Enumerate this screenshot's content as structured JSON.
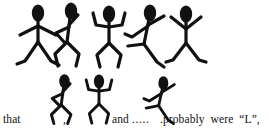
{
  "page": {
    "width": 269,
    "height": 130,
    "background_color": "#ffffff",
    "ink_color": "#111111"
  },
  "figures_row_top": [
    {
      "name": "stick-figure-arms-down-legs-spread",
      "pose": "arms angled down and out, legs spread wide with curled feet"
    },
    {
      "name": "stick-figure-arm-overhead-hand-on-hip",
      "pose": "right arm bent overhead, left hand on hip, knees bent"
    },
    {
      "name": "stick-figure-both-arms-raised",
      "pose": "both arms raised and bent upward in a U shape, knees bent"
    },
    {
      "name": "stick-figure-arms-spread-leg-kick",
      "pose": "arms spread diagonally, one leg kicked forward"
    },
    {
      "name": "stick-figure-arms-v-up",
      "pose": "arms up in a V, legs spread with curled feet"
    }
  ],
  "figures_row_bottom": [
    {
      "name": "stick-figure-arm-overhead-hand-on-hip",
      "pose": "right arm bent overhead, left hand on hip, knees bent"
    },
    {
      "name": "stick-figure-both-arms-raised",
      "pose": "both arms raised and bent upward in a U shape, knees bent"
    },
    {
      "name": "stick-figure-arms-spread-leg-kick",
      "pose": "arms spread diagonally, one leg kicked forward"
    }
  ],
  "text_line": {
    "lead_word": "that",
    "comma_after_first": ",",
    "conjunction": "and",
    "ellipsis": ".....",
    "tail": ".probably  were  “L”,"
  }
}
